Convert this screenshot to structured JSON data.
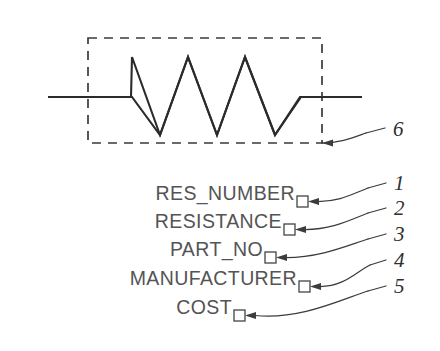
{
  "figure": {
    "background_color": "#ffffff",
    "line_color": "#2b2b2b",
    "text_color": "#545454",
    "callout_color": "#2f2f2f"
  },
  "symbol": {
    "name": "resistor-schematic-symbol",
    "dashed_boundary_label": "symbol definition boundary"
  },
  "attributes": [
    {
      "label": "RES_NUMBER",
      "callout": "1"
    },
    {
      "label": "RESISTANCE",
      "callout": "2"
    },
    {
      "label": "PART_NO",
      "callout": "3"
    },
    {
      "label": "MANUFACTURER",
      "callout": "4"
    },
    {
      "label": "COST",
      "callout": "5"
    }
  ],
  "symbol_callout": {
    "callout": "6"
  }
}
